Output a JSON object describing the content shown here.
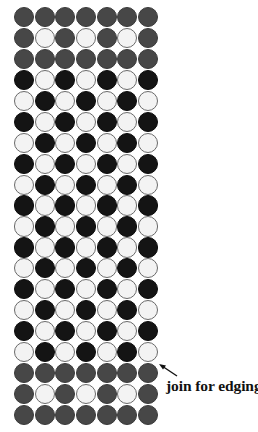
{
  "diagram": {
    "title": "",
    "columns": 7,
    "rows": 20,
    "colors": {
      "G": "#474747",
      "B": "#141414",
      "W": "#f3f3f3"
    },
    "legend_note": "G = dark grey bead, B = black bead, W = white bead",
    "pattern": [
      "GGGGGGG",
      "GWGWGWG",
      "GGGGGGG",
      "BWBWBWB",
      "WBWBWBW",
      "BWBWBWB",
      "WBWBWBW",
      "BWBWBWB",
      "WBWBWBW",
      "BWBWBWB",
      "WBWBWBW",
      "BWBWBWB",
      "WBWBWBW",
      "BWBWBWB",
      "WBWBWBW",
      "BWBWBWB",
      "WBWBWBW",
      "GGGGGGG",
      "GWGWGWG",
      "GGGGGGG"
    ],
    "annotation": {
      "text": "join for edging",
      "points_to_row": 17,
      "points_to_column": 7
    }
  }
}
